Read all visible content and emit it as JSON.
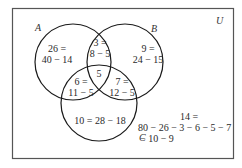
{
  "diagram": {
    "type": "venn-3",
    "universe_label": "U",
    "sets": [
      {
        "name": "A"
      },
      {
        "name": "B"
      },
      {
        "name": "C"
      }
    ],
    "regions": {
      "A_only": {
        "line1": "26 =",
        "line2": "40 − 14"
      },
      "AB_only": {
        "line1": "3 =",
        "line2": "8 − 5"
      },
      "B_only": {
        "line1": "9 =",
        "line2": "24 − 15"
      },
      "ABC": {
        "line1": "5"
      },
      "AC_only": {
        "line1": "6 =",
        "line2": "11 − 5"
      },
      "BC_only": {
        "line1": "7 =",
        "line2": "12 − 5"
      },
      "C_only": {
        "line1": "10 = 28 − 18"
      },
      "outside": {
        "line1": "14 =",
        "line2": "80 − 26 − 3 − 6 − 5 − 7",
        "line3": "− 10 − 9"
      }
    }
  }
}
